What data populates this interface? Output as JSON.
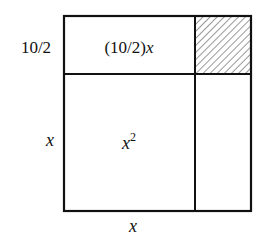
{
  "diagram": {
    "side_labels": {
      "top_left": "10/2",
      "left": "x",
      "bottom": "x"
    },
    "regions": {
      "top_rect": {
        "label_prefix": "(10/2)",
        "label_var": "x"
      },
      "main_square": {
        "label_var": "x",
        "label_exp": "2"
      },
      "corner_square": {
        "fill": "hatched"
      },
      "right_rect": {
        "label": ""
      }
    },
    "colors": {
      "stroke": "#111111",
      "background": "#ffffff",
      "hatch": "#333333"
    }
  }
}
